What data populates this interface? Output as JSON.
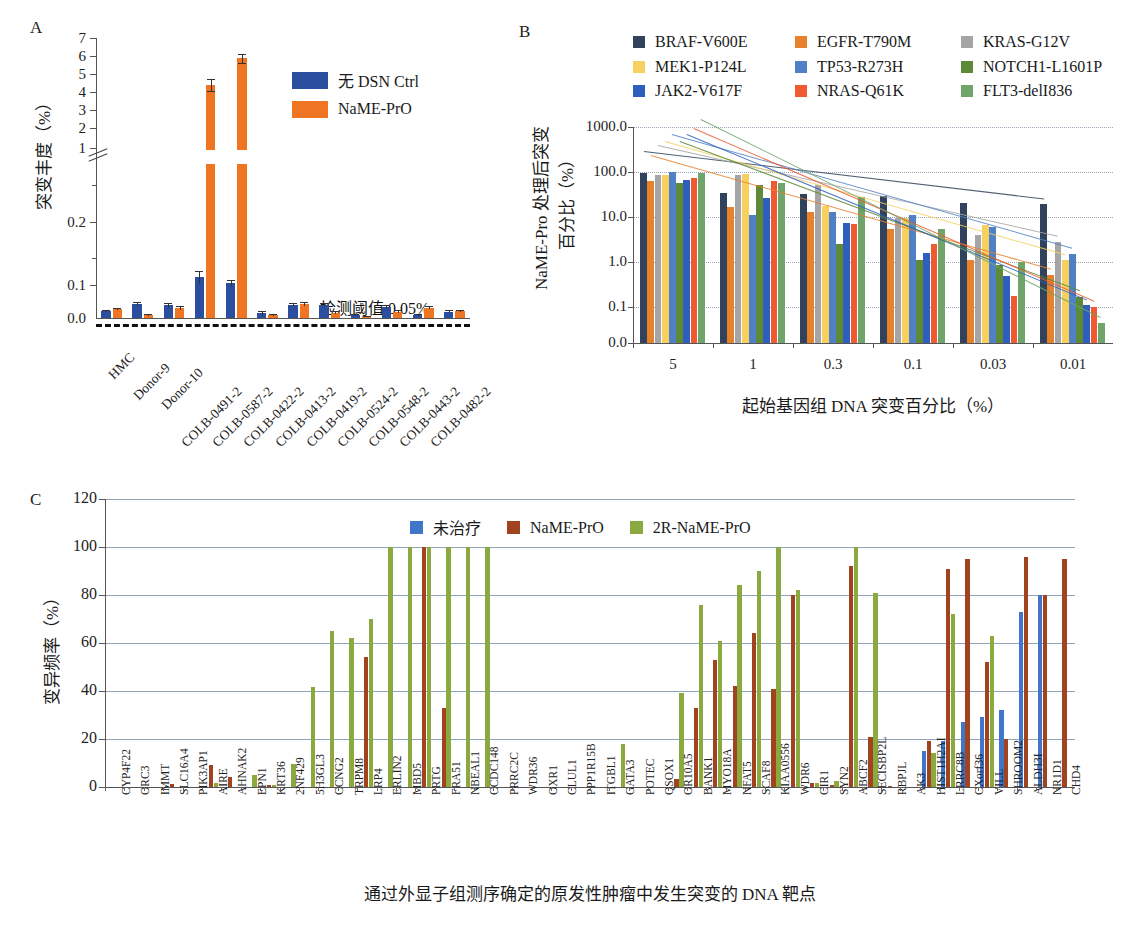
{
  "figure": {
    "panels": [
      "A",
      "B",
      "C"
    ]
  },
  "panelA": {
    "label": "A",
    "ylabel": "突变丰度（%）",
    "legend": [
      {
        "label": "无 DSN Ctrl",
        "color": "#2b4f9e"
      },
      {
        "label": "NaME-PrO",
        "color": "#f07523"
      }
    ],
    "threshold_text": "检测阈值 0.05%",
    "threshold_value": 0.05,
    "yticks_upper": [
      "7",
      "6",
      "5",
      "4",
      "3",
      "2",
      "1"
    ],
    "yticks_lower": [
      "0.2",
      "0.1",
      "0.0"
    ],
    "chart_data": {
      "type": "bar",
      "title": "",
      "xlabel": "",
      "ylabel": "突变丰度（%）",
      "axis_note": "broken y-axis: lower log-like segment 0.0-0.2, upper linear segment 1-7",
      "categories": [
        "HMC",
        "Donor-9",
        "Donor-10",
        "COLB-0491-2",
        "COLB-0587-2",
        "COLB-0422-2",
        "COLB-0413-2",
        "COLB-0419-2",
        "COLB-0524-2",
        "COLB-0548-2",
        "COLB-0443-2",
        "COLB-0482-2"
      ],
      "series": [
        {
          "name": "无 DSN Ctrl",
          "color": "#2b4f9e",
          "values": [
            0.022,
            0.042,
            0.038,
            0.112,
            0.103,
            0.014,
            0.04,
            0.038,
            0.008,
            0.034,
            0.01,
            0.019
          ],
          "errors": [
            0.003,
            0.006,
            0.007,
            0.01,
            0.005,
            0.007,
            0.005,
            0.006,
            0.003,
            0.005,
            0.003,
            0.004
          ]
        },
        {
          "name": "NaME-PrO",
          "color": "#f07523",
          "values": [
            0.026,
            0.01,
            0.03,
            4.42,
            5.9,
            0.008,
            0.042,
            0.016,
            0.005,
            0.019,
            0.031,
            0.021
          ],
          "errors": [
            0.003,
            0.003,
            0.006,
            0.33,
            0.24,
            0.003,
            0.006,
            0.004,
            0.002,
            0.005,
            0.005,
            0.004
          ]
        }
      ]
    }
  },
  "panelB": {
    "label": "B",
    "ylabel": "NaME-Pro 处理后突变\n百分比（%）",
    "ylabel_line1": "NaME-Pro 处理后突变",
    "ylabel_line2": "百分比（%）",
    "xlabel": "起始基因组 DNA 突变百分比（%）",
    "yticks": [
      "1000.0",
      "100.0",
      "10.0",
      "1.0",
      "0.1",
      "0.0"
    ],
    "chart_data": {
      "type": "bar",
      "title": "",
      "xlabel": "起始基因组 DNA 突变百分比（%）",
      "ylabel": "NaME-Pro 处理后突变百分比（%）",
      "yscale": "log",
      "ylim": [
        0.01,
        1000.0
      ],
      "categories": [
        "5",
        "1",
        "0.3",
        "0.1",
        "0.03",
        "0.01"
      ],
      "legend_position": "top",
      "series": [
        {
          "name": "BRAF-V600E",
          "color": "#31435c",
          "values": [
            95,
            34,
            33,
            29,
            21,
            19
          ]
        },
        {
          "name": "EGFR-T790M",
          "color": "#e8812b",
          "values": [
            63,
            17,
            13,
            5.4,
            1.1,
            0.52
          ]
        },
        {
          "name": "KRAS-G12V",
          "color": "#a5a5a5",
          "values": [
            85,
            85,
            52,
            9.5,
            4.0,
            2.8
          ]
        },
        {
          "name": "MEK1-P124L",
          "color": "#f7d060",
          "values": [
            86,
            90,
            18,
            9.3,
            6.5,
            1.1
          ]
        },
        {
          "name": "TP53-R273H",
          "color": "#4f81c7",
          "values": [
            98,
            11,
            13,
            11,
            5.9,
            1.5
          ]
        },
        {
          "name": "NOTCH1-L1601P",
          "color": "#5c8a36",
          "values": [
            56,
            52,
            2.5,
            1.1,
            0.85,
            0.17
          ]
        },
        {
          "name": "JAK2-V617F",
          "color": "#2f5fbe",
          "values": [
            68,
            27,
            7.3,
            1.6,
            0.48,
            0.11
          ]
        },
        {
          "name": "NRAS-Q61K",
          "color": "#ef5a30",
          "values": [
            72,
            62,
            7.0,
            2.5,
            0.18,
            0.1
          ]
        },
        {
          "name": "FLT3-delI836",
          "color": "#6fa56a",
          "values": [
            95,
            56,
            28,
            5.5,
            1.0,
            0.055
          ]
        }
      ]
    }
  },
  "panelC": {
    "label": "C",
    "ylabel": "变异频率（%）",
    "xlabel": "通过外显子组测序确定的原发性肿瘤中发生突变的 DNA 靶点",
    "yticks": [
      "120",
      "100",
      "80",
      "60",
      "40",
      "20",
      "0"
    ],
    "legend": [
      {
        "label": "未治疗",
        "color": "#3f76c9"
      },
      {
        "label": "NaME-PrO",
        "color": "#a0431e"
      },
      {
        "label": "2R-NaME-PrO",
        "color": "#8aa93f"
      }
    ],
    "chart_data": {
      "type": "bar",
      "title": "",
      "xlabel": "通过外显子组测序确定的原发性肿瘤中发生突变的 DNA 靶点",
      "ylabel": "变异频率（%）",
      "ylim": [
        0,
        120
      ],
      "categories": [
        "CYP4F22",
        "ORC3",
        "IMMT",
        "SLC16A4",
        "PIK3AP1",
        "AIRE",
        "AHNAK2",
        "EPN1",
        "KRT36",
        "2NF429",
        "5H3GL3",
        "CCNG2",
        "TRPM8",
        "LRP4",
        "ERLIN2",
        "MBD5",
        "PRTG",
        "FRA51",
        "NBEAL1",
        "CCDC148",
        "PRRC2C",
        "WDR36",
        "OXR1",
        "CLUL1",
        "PPP1R15B",
        "ITGBL1",
        "GATA3",
        "POTEC",
        "QSOX1",
        "OR10A5",
        "BANK1",
        "MYO18A",
        "NFAT5",
        "SCAF8",
        "KIAA0556",
        "WDR6",
        "CIR1",
        "SYN2",
        "ABCF2",
        "SECISBP2L",
        "RBPJL",
        "AK3",
        "HIST1H2AI",
        "LRRC8B",
        "CXorf36",
        "VILL",
        "SHROOM2",
        "ALDH3I",
        "NR1D1",
        "CHD4"
      ],
      "series": [
        {
          "name": "未治疗",
          "color": "#3f76c9",
          "values": [
            0,
            0,
            0,
            0.6,
            0,
            0,
            0,
            0,
            0,
            0,
            0,
            0,
            0,
            0,
            0,
            0,
            0,
            0,
            0,
            0,
            0,
            0,
            0,
            0,
            0,
            0,
            0,
            0,
            0,
            0,
            0,
            0,
            0,
            0,
            0,
            0,
            0,
            0,
            0,
            0,
            0,
            0,
            15,
            19,
            27,
            29,
            32,
            73,
            80,
            0
          ]
        },
        {
          "name": "NaME-PrO",
          "color": "#a0431e",
          "values": [
            0,
            0,
            0,
            1.2,
            0,
            9,
            4,
            0,
            1,
            0,
            0,
            0,
            0,
            54,
            0,
            0,
            100,
            33,
            0,
            0,
            0,
            0,
            0,
            0,
            0,
            0,
            0,
            0,
            0,
            3.5,
            33,
            53,
            42,
            64,
            41,
            80,
            1.8,
            1,
            92,
            21,
            0.5,
            0,
            19,
            91,
            95,
            52,
            20,
            96,
            80,
            95
          ]
        },
        {
          "name": "2R-NaME-PrO",
          "color": "#8aa93f",
          "values": [
            0,
            0,
            0,
            0,
            0,
            1.5,
            0,
            5,
            0.8,
            9.5,
            41.5,
            65,
            62,
            70,
            100,
            100,
            100,
            100,
            100,
            100,
            0,
            0,
            0,
            0,
            0,
            0,
            18,
            0,
            0,
            39,
            76,
            61,
            84,
            90,
            100,
            82,
            1.8,
            2.5,
            100,
            81,
            0,
            0,
            14,
            72,
            0,
            63,
            0,
            0,
            0,
            0
          ]
        }
      ]
    }
  }
}
